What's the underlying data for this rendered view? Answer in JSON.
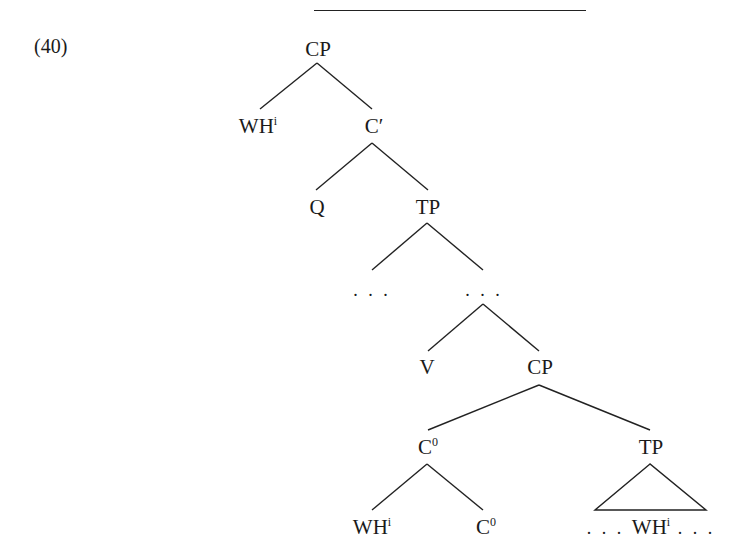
{
  "example_number": "(40)",
  "tree": {
    "root": {
      "label": "CP"
    },
    "wh_spec": {
      "label": "WH",
      "sup": "i"
    },
    "c_bar": {
      "label": "C′"
    },
    "q": {
      "label": "Q"
    },
    "tp1": {
      "label": "TP"
    },
    "ellipsis_left": {
      "label": ". . ."
    },
    "ellipsis_right": {
      "label": ". . ."
    },
    "v": {
      "label": "V"
    },
    "cp2": {
      "label": "CP"
    },
    "c0_upper": {
      "label": "C",
      "sup": "0"
    },
    "tp2": {
      "label": "TP"
    },
    "wh_lower": {
      "label": "WH",
      "sup": "i"
    },
    "c0_lower": {
      "label": "C",
      "sup": "0"
    },
    "tp2_content": {
      "prefix": ". . . ",
      "label": "WH",
      "sup": "i",
      "suffix": " . . ."
    }
  }
}
